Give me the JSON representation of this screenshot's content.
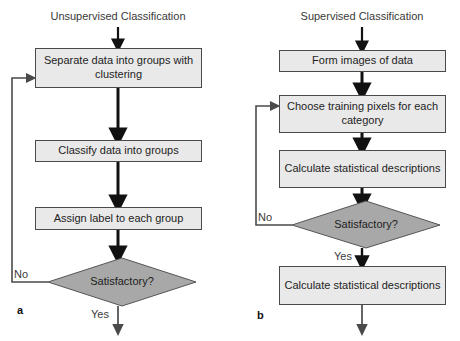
{
  "figure": {
    "type": "flowchart",
    "background": "#ffffff",
    "box_fill": "#e9e9e9",
    "box_stroke": "#4a4a4a",
    "diamond_fill": "#a8a8a8",
    "diamond_stroke": "#555555",
    "arrow_color": "#111111",
    "loop_color": "#4a4a4a"
  },
  "panels": [
    {
      "letter": "a",
      "title": "Unsupervised Classification",
      "nodes": [
        {
          "id": "u1",
          "shape": "process",
          "label": "Separate data into groups with clustering"
        },
        {
          "id": "u2",
          "shape": "process",
          "label": "Classify data into groups"
        },
        {
          "id": "u3",
          "shape": "process",
          "label": "Assign label to each group"
        },
        {
          "id": "u4",
          "shape": "decision",
          "label": "Satisfactory?"
        }
      ],
      "edges": [
        {
          "from": "start",
          "to": "u1",
          "label": ""
        },
        {
          "from": "u1",
          "to": "u2",
          "label": ""
        },
        {
          "from": "u2",
          "to": "u3",
          "label": ""
        },
        {
          "from": "u3",
          "to": "u4",
          "label": ""
        },
        {
          "from": "u4",
          "to": "u1",
          "label": "No"
        },
        {
          "from": "u4",
          "to": "end",
          "label": "Yes"
        }
      ]
    },
    {
      "letter": "b",
      "title": "Supervised Classification",
      "nodes": [
        {
          "id": "s1",
          "shape": "process",
          "label": "Form images of data"
        },
        {
          "id": "s2",
          "shape": "process",
          "label": "Choose training pixels for each category"
        },
        {
          "id": "s3",
          "shape": "process",
          "label": "Calculate statistical descriptions"
        },
        {
          "id": "s4",
          "shape": "decision",
          "label": "Satisfactory?"
        },
        {
          "id": "s5",
          "shape": "process",
          "label": "Calculate statistical descriptions"
        }
      ],
      "edges": [
        {
          "from": "start",
          "to": "s1",
          "label": ""
        },
        {
          "from": "s1",
          "to": "s2",
          "label": ""
        },
        {
          "from": "s2",
          "to": "s3",
          "label": ""
        },
        {
          "from": "s3",
          "to": "s4",
          "label": ""
        },
        {
          "from": "s4",
          "to": "s2",
          "label": "No"
        },
        {
          "from": "s4",
          "to": "s5",
          "label": "Yes"
        },
        {
          "from": "s5",
          "to": "end",
          "label": ""
        }
      ]
    }
  ],
  "labels": {
    "no_left": "No",
    "yes_left": "Yes",
    "no_right": "No",
    "yes_right": "Yes"
  }
}
